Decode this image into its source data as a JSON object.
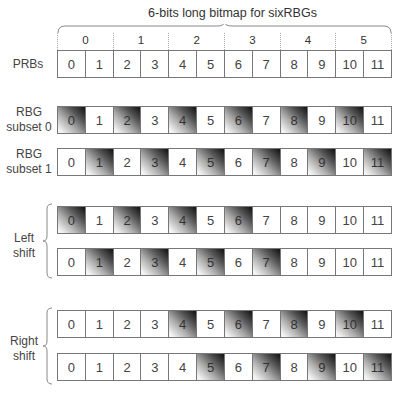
{
  "title": "6-bits long bitmap for sixRBGs",
  "rbg_indices": [
    "0",
    "1",
    "2",
    "3",
    "4",
    "5"
  ],
  "prb_cells": [
    "0",
    "1",
    "2",
    "3",
    "4",
    "5",
    "6",
    "7",
    "8",
    "9",
    "10",
    "11"
  ],
  "rows": [
    {
      "id": "prbs",
      "label_lines": [
        "PRBs"
      ],
      "shaded": []
    },
    {
      "id": "rbg-subset-0",
      "label_lines": [
        "RBG",
        "subset 0"
      ],
      "shaded": [
        0,
        2,
        4,
        6,
        8,
        10
      ]
    },
    {
      "id": "rbg-subset-1",
      "label_lines": [
        "RBG",
        "subset 1"
      ],
      "shaded": [
        1,
        3,
        5,
        7,
        9,
        11
      ]
    },
    {
      "id": "left-shift-subset-0",
      "shaded": [
        0,
        2,
        4,
        6
      ]
    },
    {
      "id": "left-shift-subset-1",
      "shaded": [
        1,
        3,
        5,
        7
      ]
    },
    {
      "id": "right-shift-subset-0",
      "shaded": [
        4,
        6,
        8,
        10
      ]
    },
    {
      "id": "right-shift-subset-1",
      "shaded": [
        5,
        7,
        9,
        11
      ]
    }
  ],
  "labels": {
    "prbs": "PRBs",
    "rbg": "RBG",
    "subset0": "subset 0",
    "subset1": "subset 1",
    "left": "Left",
    "right": "Right",
    "shift": "shift"
  },
  "colors": {
    "cell_border": "#777777",
    "shade_dark": "#111111",
    "shade_light": "#f4f4f4",
    "text": "#444444"
  }
}
